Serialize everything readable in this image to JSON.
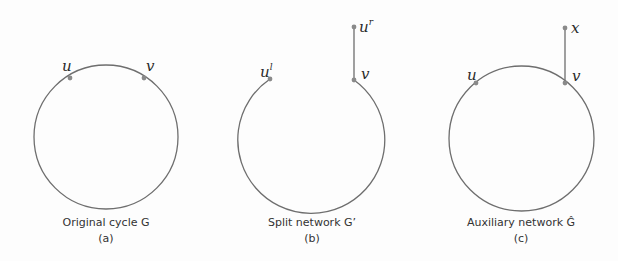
{
  "panels": [
    {
      "id": "a",
      "caption": "Original cycle G",
      "sublabel": "(a)",
      "vertices": [
        {
          "label": "u",
          "sup": ""
        },
        {
          "label": "v",
          "sup": ""
        }
      ]
    },
    {
      "id": "b",
      "caption": "Split network G’",
      "sublabel": "(b)",
      "vertices": [
        {
          "label": "u",
          "sup": "l"
        },
        {
          "label": "v",
          "sup": ""
        },
        {
          "label": "u",
          "sup": "r"
        }
      ]
    },
    {
      "id": "c",
      "caption": "Auxiliary network Ĝ",
      "sublabel": "(c)",
      "vertices": [
        {
          "label": "u",
          "sup": ""
        },
        {
          "label": "v",
          "sup": ""
        },
        {
          "label": "x",
          "sup": ""
        }
      ]
    }
  ],
  "colors": {
    "edge": "#6e6e6e",
    "node": "#8a8a8a",
    "text": "#333333"
  }
}
